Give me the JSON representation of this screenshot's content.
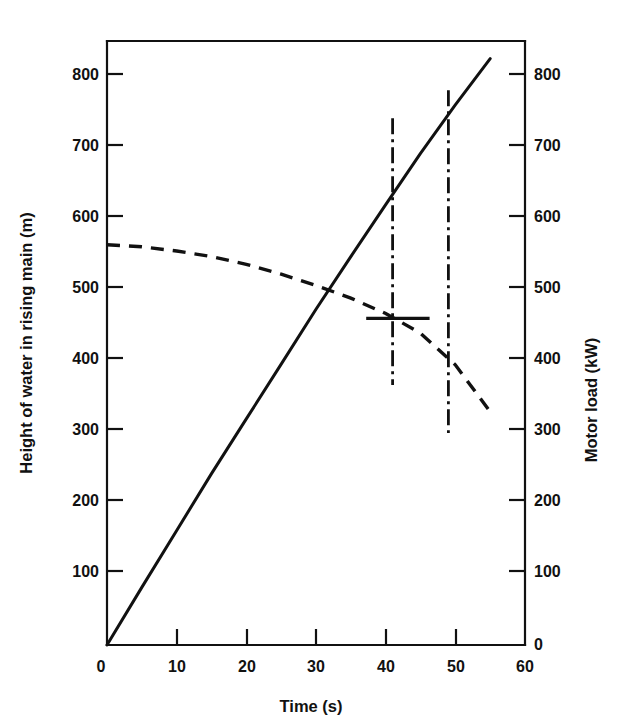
{
  "chart_data": {
    "type": "line",
    "title": "",
    "xlabel": "Time (s)",
    "ylabel": "Height of water in rising main (m)",
    "y2label": "Motor load (kW)",
    "xlim": [
      0,
      60
    ],
    "ylim": [
      0,
      860
    ],
    "y2lim": [
      0,
      860
    ],
    "grid": false,
    "legend": "none",
    "xticks": [
      0,
      10,
      20,
      30,
      40,
      50,
      60
    ],
    "xticklabels": [
      "0",
      "10",
      "20",
      "30",
      "40",
      "50",
      "60"
    ],
    "yticks": [
      0,
      100,
      200,
      300,
      400,
      500,
      600,
      700,
      800
    ],
    "yticklabels": [
      "0",
      "100",
      "200",
      "300",
      "400",
      "500",
      "600",
      "700",
      "800"
    ],
    "y2ticks": [
      0,
      100,
      200,
      300,
      400,
      500,
      600,
      700,
      800
    ],
    "y2ticklabels": [
      "0",
      "100",
      "200",
      "300",
      "400",
      "500",
      "600",
      "700",
      "800"
    ],
    "series": [
      {
        "name": "Height of water in rising main",
        "axis": "left",
        "style": "solid",
        "x": [
          0,
          5,
          10,
          15,
          20,
          25,
          30,
          35,
          40,
          45,
          50,
          55
        ],
        "values": [
          0,
          82,
          163,
          244,
          322,
          400,
          478,
          553,
          627,
          700,
          769,
          835
        ]
      },
      {
        "name": "Motor load",
        "axis": "right",
        "style": "dashed",
        "x": [
          0,
          5,
          10,
          15,
          20,
          25,
          30,
          35,
          40,
          45,
          50,
          55
        ],
        "values": [
          570,
          567,
          561,
          553,
          542,
          528,
          512,
          494,
          472,
          444,
          399,
          332
        ]
      }
    ],
    "annotations": [
      {
        "name": "operating-marker-1",
        "type": "vertical-dashdot",
        "x": 41,
        "y_from": 370,
        "y_to": 750
      },
      {
        "name": "operating-marker-2",
        "type": "vertical-dashdot",
        "x": 49,
        "y_from": 302,
        "y_to": 790
      },
      {
        "name": "operating-point-bar",
        "type": "horizontal-bar",
        "y": 465,
        "x_from": 37.2,
        "x_to": 46.3
      }
    ]
  }
}
